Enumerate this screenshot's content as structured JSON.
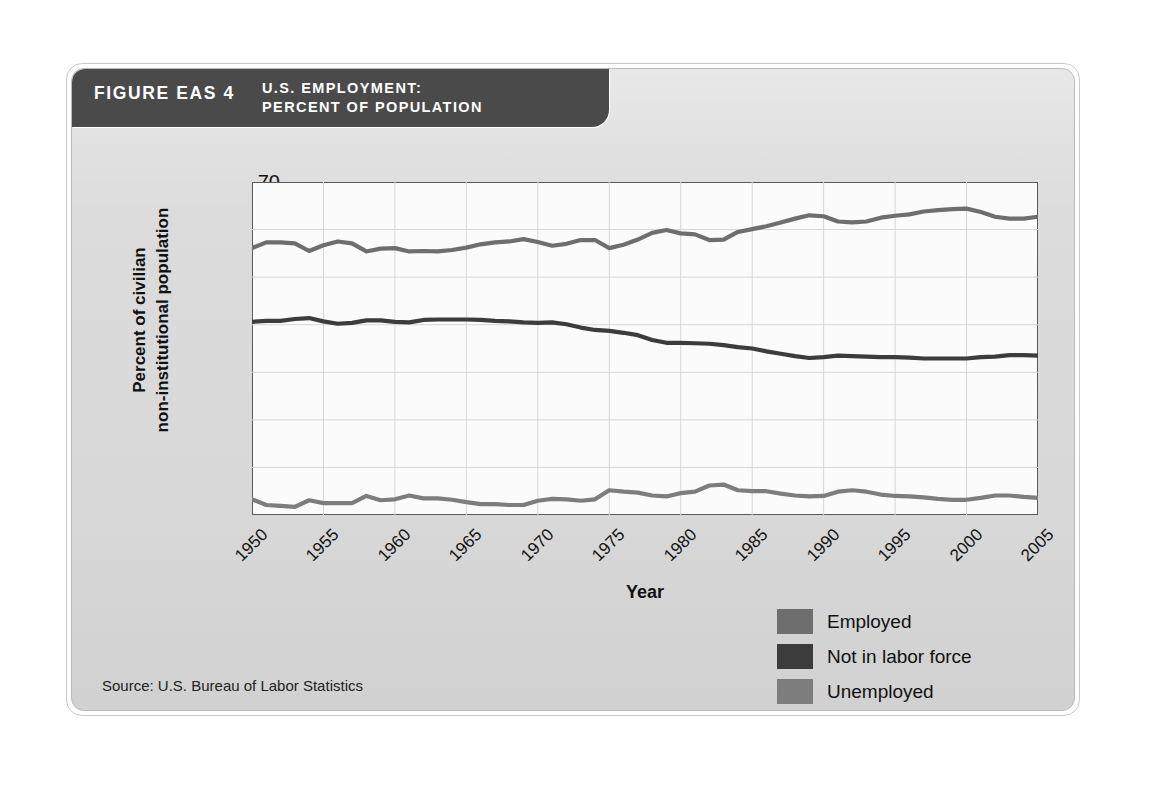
{
  "figure": {
    "number_label": "FIGURE EAS 4",
    "title_line1": "U.S. EMPLOYMENT:",
    "title_line2": "PERCENT OF POPULATION",
    "source": "Source: U.S. Bureau of Labor Statistics"
  },
  "colors": {
    "header_bar": "#4a4a4a",
    "panel": "#dcdcdc",
    "plot_background": "#fbfbfb",
    "axis": "#5a5a5a",
    "gridline": "#d6d6d6",
    "employed": "#6e6e6e",
    "not_in_labor_force": "#3c3c3c",
    "unemployed": "#7d7d7d"
  },
  "legend": {
    "position": "bottom-right",
    "items": [
      {
        "label": "Employed",
        "color": "#6e6e6e"
      },
      {
        "label": "Not in labor force",
        "color": "#3c3c3c"
      },
      {
        "label": "Unemployed",
        "color": "#7d7d7d"
      }
    ]
  },
  "chart_data": {
    "type": "line",
    "title": "U.S. EMPLOYMENT: PERCENT OF POPULATION",
    "xlabel": "Year",
    "ylabel": "Percent of civilian non-institutional population",
    "ylabel_line1": "Percent of civilian",
    "ylabel_line2": "non-institutional population",
    "xlim": [
      1950,
      2005
    ],
    "ylim": [
      0,
      70
    ],
    "yticks": [
      10,
      20,
      30,
      40,
      50,
      60,
      70
    ],
    "xticks": [
      1950,
      1955,
      1960,
      1965,
      1970,
      1975,
      1980,
      1985,
      1990,
      1995,
      2000,
      2005
    ],
    "grid": true,
    "legend_position": "bottom-right",
    "x": [
      1950,
      1951,
      1952,
      1953,
      1954,
      1955,
      1956,
      1957,
      1958,
      1959,
      1960,
      1961,
      1962,
      1963,
      1964,
      1965,
      1966,
      1967,
      1968,
      1969,
      1970,
      1971,
      1972,
      1973,
      1974,
      1975,
      1976,
      1977,
      1978,
      1979,
      1980,
      1981,
      1982,
      1983,
      1984,
      1985,
      1986,
      1987,
      1988,
      1989,
      1990,
      1991,
      1992,
      1993,
      1994,
      1995,
      1996,
      1997,
      1998,
      1999,
      2000,
      2001,
      2002,
      2003,
      2004,
      2005
    ],
    "series": [
      {
        "name": "Employed",
        "color": "#6e6e6e",
        "values": [
          56.1,
          57.3,
          57.3,
          57.1,
          55.5,
          56.7,
          57.5,
          57.1,
          55.4,
          56.0,
          56.1,
          55.4,
          55.5,
          55.4,
          55.7,
          56.2,
          56.9,
          57.3,
          57.5,
          58.0,
          57.4,
          56.6,
          57.0,
          57.8,
          57.8,
          56.1,
          56.8,
          57.9,
          59.3,
          59.9,
          59.2,
          59.0,
          57.8,
          57.9,
          59.5,
          60.1,
          60.7,
          61.5,
          62.3,
          63.0,
          62.8,
          61.7,
          61.5,
          61.7,
          62.5,
          62.9,
          63.2,
          63.8,
          64.1,
          64.3,
          64.4,
          63.7,
          62.7,
          62.3,
          62.3,
          62.7
        ]
      },
      {
        "name": "Not in labor force",
        "color": "#3c3c3c",
        "values": [
          40.6,
          40.8,
          40.8,
          41.2,
          41.4,
          40.7,
          40.2,
          40.4,
          40.9,
          40.9,
          40.6,
          40.5,
          41.0,
          41.1,
          41.1,
          41.1,
          41.0,
          40.8,
          40.7,
          40.5,
          40.4,
          40.5,
          40.1,
          39.4,
          38.9,
          38.7,
          38.3,
          37.8,
          36.8,
          36.2,
          36.2,
          36.1,
          36.0,
          35.7,
          35.3,
          35.0,
          34.4,
          33.9,
          33.4,
          33.0,
          33.2,
          33.5,
          33.4,
          33.3,
          33.2,
          33.2,
          33.1,
          32.9,
          32.9,
          32.9,
          32.9,
          33.2,
          33.3,
          33.6,
          33.6,
          33.5
        ]
      },
      {
        "name": "Unemployed",
        "color": "#7d7d7d",
        "values": [
          3.3,
          2.1,
          1.9,
          1.7,
          3.1,
          2.5,
          2.5,
          2.5,
          4.0,
          3.1,
          3.3,
          4.1,
          3.5,
          3.5,
          3.2,
          2.7,
          2.3,
          2.3,
          2.1,
          2.1,
          3.0,
          3.4,
          3.3,
          3.0,
          3.3,
          5.2,
          4.9,
          4.7,
          4.1,
          3.9,
          4.6,
          4.9,
          6.2,
          6.4,
          5.2,
          5.0,
          5.0,
          4.5,
          4.1,
          3.9,
          4.0,
          4.9,
          5.2,
          4.9,
          4.3,
          4.0,
          3.9,
          3.7,
          3.4,
          3.2,
          3.2,
          3.6,
          4.1,
          4.1,
          3.8,
          3.6
        ]
      }
    ]
  }
}
